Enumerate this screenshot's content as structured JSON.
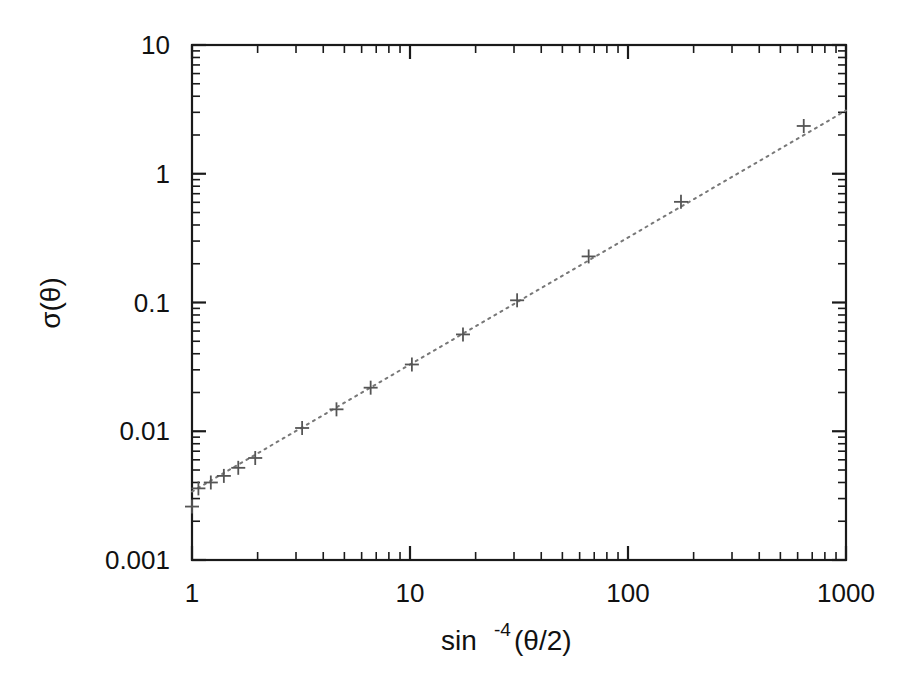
{
  "figure": {
    "background_color": "#ffffff",
    "frame_color": "#1a1a1a",
    "marker_color": "#555555",
    "fitline_color": "#777777"
  },
  "axes": {
    "x": {
      "label_main": "sin",
      "label_sup": "-4",
      "label_tail": "(θ/2)",
      "label_full": "sin-4(θ/2)",
      "scale": "log",
      "min": 1,
      "max": 1000,
      "tick_labels": [
        "1",
        "10",
        "100",
        "1000"
      ],
      "tick_values": [
        1,
        10,
        100,
        1000
      ]
    },
    "y": {
      "label_full": "σ(θ)",
      "scale": "log",
      "min": 0.001,
      "max": 10,
      "tick_labels": [
        "10",
        "1",
        "0.1",
        "0.01",
        "0.001"
      ],
      "tick_values": [
        10,
        1,
        0.1,
        0.01,
        0.001
      ]
    }
  },
  "chart_data": {
    "type": "scatter",
    "title": "",
    "xlabel": "sin-4(θ/2)",
    "ylabel": "σ(θ)",
    "xscale": "log",
    "yscale": "log",
    "xlim": [
      1,
      1000
    ],
    "ylim": [
      0.001,
      10
    ],
    "grid": false,
    "legend": "none",
    "marker": "plus",
    "series": [
      {
        "name": "measured cross section",
        "marker": "+",
        "x": [
          1.0,
          1.07,
          1.22,
          1.4,
          1.63,
          1.95,
          3.2,
          4.6,
          6.6,
          10.2,
          17.5,
          31.0,
          66.0,
          175.0,
          640.0
        ],
        "y": [
          0.0026,
          0.0036,
          0.004,
          0.0045,
          0.0052,
          0.0062,
          0.0106,
          0.0148,
          0.0218,
          0.033,
          0.0565,
          0.104,
          0.228,
          0.605,
          2.35
        ]
      },
      {
        "name": "power-law fit",
        "style": "dotted",
        "x": [
          1,
          1000
        ],
        "y": [
          0.0034,
          3.1
        ]
      }
    ]
  }
}
